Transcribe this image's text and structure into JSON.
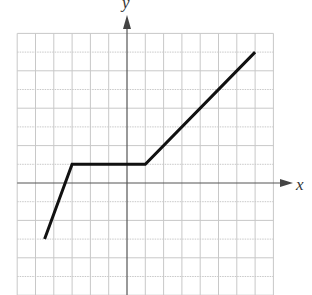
{
  "chart_data": {
    "type": "line",
    "title": "",
    "xlabel": "x",
    "ylabel": "y",
    "xlim": [
      -6,
      8
    ],
    "ylim": [
      -6,
      8
    ],
    "grid": true,
    "tick_labels": false,
    "series": [
      {
        "name": "piecewise-linear",
        "points": [
          [
            -4.5,
            -3
          ],
          [
            -3,
            1
          ],
          [
            1,
            1
          ],
          [
            7,
            7
          ]
        ]
      }
    ]
  },
  "layout": {
    "origin_px": [
      127,
      183
    ],
    "unit_px": [
      18.3,
      18.7
    ],
    "grid_color": "#c8c8c8",
    "axis_color": "#555555",
    "line_color": "#111111"
  }
}
